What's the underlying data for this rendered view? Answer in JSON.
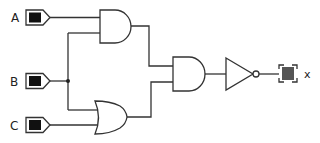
{
  "diagram": {
    "type": "logic-circuit",
    "colors": {
      "wire": "#333333",
      "input_fill": "#111111",
      "output_fill": "#555555",
      "background": "#ffffff"
    },
    "inputs": [
      {
        "id": "A",
        "label": "A"
      },
      {
        "id": "B",
        "label": "B"
      },
      {
        "id": "C",
        "label": "C"
      }
    ],
    "gates": [
      {
        "id": "and1",
        "type": "AND",
        "inputs": [
          "A",
          "B"
        ]
      },
      {
        "id": "or1",
        "type": "OR",
        "inputs": [
          "B",
          "C"
        ]
      },
      {
        "id": "and2",
        "type": "AND",
        "inputs": [
          "and1",
          "or1"
        ]
      },
      {
        "id": "not1",
        "type": "NOT",
        "inputs": [
          "and2"
        ]
      }
    ],
    "output": {
      "id": "x",
      "label": "x",
      "source": "not1"
    },
    "expression": "x = NOT((A AND B) AND (B OR C))"
  }
}
